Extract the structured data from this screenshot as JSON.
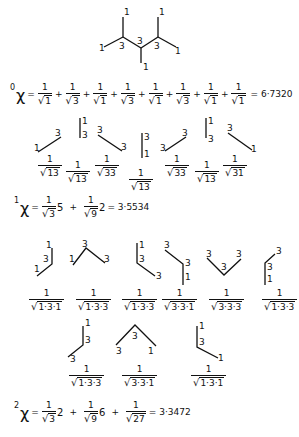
{
  "molecule": {
    "description": "2,3,4-trimethylpentane hydrogen-suppressed graph with vertex degrees",
    "vertex_labels": [
      "1",
      "1",
      "1",
      "3",
      "3",
      "3",
      "1",
      "1",
      "1"
    ]
  },
  "chi0": {
    "order": "0",
    "symbol": "χ",
    "terms": [
      {
        "num": "1",
        "den": "1"
      },
      {
        "num": "1",
        "den": "3"
      },
      {
        "num": "1",
        "den": "1"
      },
      {
        "num": "1",
        "den": "3"
      },
      {
        "num": "1",
        "den": "1"
      },
      {
        "num": "1",
        "den": "3"
      },
      {
        "num": "1",
        "den": "1"
      },
      {
        "num": "1",
        "den": "1"
      }
    ],
    "result": "= 6·7320"
  },
  "chi1_edges": [
    {
      "den": "13"
    },
    {
      "den": "13"
    },
    {
      "den": "33"
    },
    {
      "den": "13"
    },
    {
      "den": "33"
    },
    {
      "den": "13"
    },
    {
      "den": "31"
    }
  ],
  "chi1": {
    "order": "1",
    "symbol": "χ",
    "term1": {
      "num": "1",
      "den": "3",
      "mult": "5"
    },
    "term2": {
      "num": "1",
      "den": "9",
      "mult": "2"
    },
    "result": "= 3·5534"
  },
  "chi2_paths_row1": [
    {
      "den": "1·3·1"
    },
    {
      "den": "1·3·3"
    },
    {
      "den": "1·3·3"
    },
    {
      "den": "3·3·1"
    },
    {
      "den": "3·3·3"
    },
    {
      "den": "1·3·3"
    }
  ],
  "chi2_paths_row2": [
    {
      "den": "1·3·3"
    },
    {
      "den": "3·3·1"
    },
    {
      "den": "1·3·1"
    }
  ],
  "chi2": {
    "order": "2",
    "symbol": "χ",
    "term1": {
      "num": "1",
      "den": "3",
      "mult": "2"
    },
    "term2": {
      "num": "1",
      "den": "9",
      "mult": "6"
    },
    "term3": {
      "num": "1",
      "den": "27"
    },
    "result": "= 3·3472"
  },
  "labels": {
    "plus": "+",
    "eq": "=",
    "one": "1",
    "three": "3",
    "sqrt": "√"
  }
}
